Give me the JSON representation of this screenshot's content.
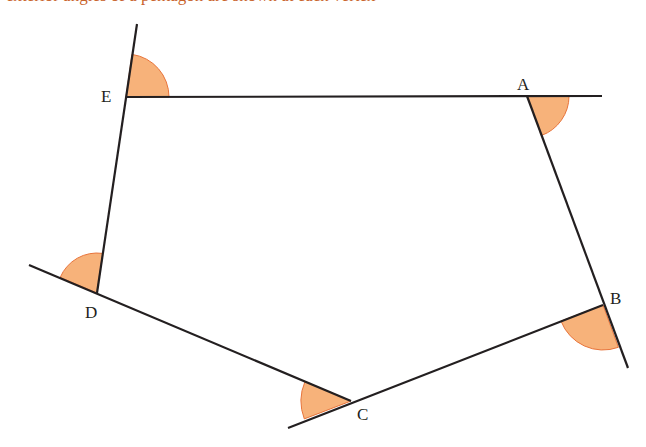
{
  "caption": "exterior angles of a pentagon are shown at each vertex",
  "diagram": {
    "type": "pentagon-exterior-angles",
    "colors": {
      "line": "#231f20",
      "angle_fill": "#f7b27a",
      "angle_stroke": "#e8743b",
      "caption": "#c8622a"
    },
    "vertices": [
      {
        "label": "A",
        "x": 527,
        "y": 96
      },
      {
        "label": "B",
        "x": 603,
        "y": 305
      },
      {
        "label": "C",
        "x": 351,
        "y": 401
      },
      {
        "label": "D",
        "x": 97,
        "y": 293
      },
      {
        "label": "E",
        "x": 126,
        "y": 97
      }
    ],
    "labels": {
      "A": "A",
      "B": "B",
      "C": "C",
      "D": "D",
      "E": "E"
    }
  }
}
